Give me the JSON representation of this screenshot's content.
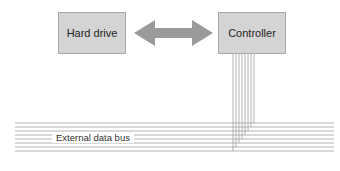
{
  "diagram": {
    "nodes": [
      {
        "id": "hard-drive",
        "label": "Hard drive"
      },
      {
        "id": "controller",
        "label": "Controller"
      }
    ],
    "edges": [
      {
        "from": "hard-drive",
        "to": "controller",
        "type": "bidirectional-arrow"
      },
      {
        "from": "controller",
        "to": "external-data-bus",
        "type": "wire-bundle",
        "wires": 8
      }
    ],
    "bus": {
      "label": "External data bus",
      "lines": 8
    },
    "colors": {
      "box_fill": "#d4d4d4",
      "box_border": "#a8a8a8",
      "arrow": "#9a9a9a",
      "wire": "#9a9a9a"
    }
  }
}
